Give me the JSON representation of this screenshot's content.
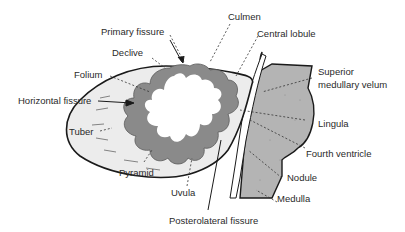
{
  "diagram": {
    "colors": {
      "cortex_fill": "#ececec",
      "gray_matter": "#8a8a8a",
      "white_matter": "#ffffff",
      "brainstem_fill": "#b4b4b4",
      "outline": "#1a1a1a",
      "label_text": "#2a2a2a"
    },
    "labels": [
      {
        "id": "primary-fissure",
        "text": "Primary fissure"
      },
      {
        "id": "culmen",
        "text": "Culmen"
      },
      {
        "id": "declive",
        "text": "Declive"
      },
      {
        "id": "central-lobule",
        "text": "Central lobule"
      },
      {
        "id": "folium",
        "text": "Folium"
      },
      {
        "id": "superior-medullary-velum-1",
        "text": "Superior"
      },
      {
        "id": "superior-medullary-velum-2",
        "text": "medullary velum"
      },
      {
        "id": "horizontal-fissure",
        "text": "Horizontal fissure"
      },
      {
        "id": "tuber",
        "text": "Tuber"
      },
      {
        "id": "lingula",
        "text": "Lingula"
      },
      {
        "id": "fourth-ventricle",
        "text": "Fourth ventricle"
      },
      {
        "id": "pyramid",
        "text": "Pyramid"
      },
      {
        "id": "nodule",
        "text": "Nodule"
      },
      {
        "id": "uvula",
        "text": "Uvula"
      },
      {
        "id": "medulla",
        "text": "Medulla"
      },
      {
        "id": "posterolateral-fissure",
        "text": "Posterolateral fissure"
      }
    ]
  }
}
